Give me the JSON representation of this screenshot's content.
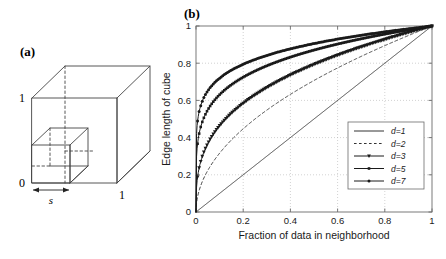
{
  "figure": {
    "panel_a": {
      "label": "(a)",
      "axis_labels": {
        "origin": "0",
        "y_top": "1",
        "x_right": "1"
      },
      "edge_label": "s",
      "description": "unit-cube-with-sub-cube"
    },
    "panel_b": {
      "label": "(b)"
    }
  },
  "chart_data": {
    "type": "line",
    "title": "",
    "xlabel": "Fraction of data in neighborhood",
    "ylabel": "Edge length of cube",
    "xlim": [
      0,
      1
    ],
    "ylim": [
      0,
      1
    ],
    "xticks": [
      "0",
      "0.2",
      "0.4",
      "0.6",
      "0.8",
      "1"
    ],
    "xtick_values": [
      0,
      0.2,
      0.4,
      0.6,
      0.8,
      1
    ],
    "yticks": [
      "0",
      "0.2",
      "0.4",
      "0.6",
      "0.8",
      "1"
    ],
    "ytick_values": [
      0,
      0.2,
      0.4,
      0.6,
      0.8,
      1
    ],
    "grid": true,
    "legend_position": "lower-right-inside",
    "x": [
      0,
      0.01,
      0.02,
      0.03,
      0.05,
      0.07,
      0.1,
      0.15,
      0.2,
      0.25,
      0.3,
      0.35,
      0.4,
      0.45,
      0.5,
      0.55,
      0.6,
      0.65,
      0.7,
      0.75,
      0.8,
      0.85,
      0.9,
      0.95,
      1
    ],
    "series": [
      {
        "name": "d=1",
        "d": 1,
        "style": "solid",
        "marker": "none",
        "color": "#333333",
        "values": [
          0,
          0.01,
          0.02,
          0.03,
          0.05,
          0.07,
          0.1,
          0.15,
          0.2,
          0.25,
          0.3,
          0.35,
          0.4,
          0.45,
          0.5,
          0.55,
          0.6,
          0.65,
          0.7,
          0.75,
          0.8,
          0.85,
          0.9,
          0.95,
          1
        ]
      },
      {
        "name": "d=2",
        "d": 2,
        "style": "dashed",
        "marker": "none",
        "color": "#333333",
        "values": [
          0,
          0.1,
          0.141,
          0.173,
          0.224,
          0.265,
          0.316,
          0.387,
          0.447,
          0.5,
          0.548,
          0.592,
          0.632,
          0.671,
          0.707,
          0.742,
          0.775,
          0.806,
          0.837,
          0.866,
          0.894,
          0.922,
          0.949,
          0.975,
          1
        ]
      },
      {
        "name": "d=3",
        "d": 3,
        "style": "solid",
        "marker": "triangle-down",
        "color": "#1a1a1a",
        "values": [
          0,
          0.215,
          0.271,
          0.311,
          0.368,
          0.412,
          0.464,
          0.531,
          0.585,
          0.63,
          0.669,
          0.705,
          0.737,
          0.766,
          0.794,
          0.819,
          0.843,
          0.866,
          0.888,
          0.909,
          0.928,
          0.947,
          0.965,
          0.983,
          1
        ]
      },
      {
        "name": "d=5",
        "d": 5,
        "style": "solid",
        "marker": "square",
        "color": "#1a1a1a",
        "values": [
          0,
          0.398,
          0.457,
          0.494,
          0.549,
          0.587,
          0.631,
          0.684,
          0.725,
          0.758,
          0.786,
          0.811,
          0.833,
          0.852,
          0.871,
          0.888,
          0.903,
          0.918,
          0.931,
          0.944,
          0.956,
          0.968,
          0.979,
          0.99,
          1
        ]
      },
      {
        "name": "d=7",
        "d": 7,
        "style": "solid",
        "marker": "circle",
        "color": "#1a1a1a",
        "values": [
          0,
          0.518,
          0.572,
          0.605,
          0.652,
          0.684,
          0.72,
          0.764,
          0.797,
          0.823,
          0.845,
          0.864,
          0.881,
          0.896,
          0.906,
          0.919,
          0.93,
          0.941,
          0.951,
          0.96,
          0.969,
          0.977,
          0.985,
          0.993,
          1
        ]
      }
    ]
  }
}
